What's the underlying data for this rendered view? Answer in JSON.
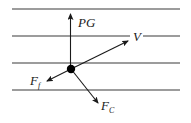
{
  "diagram": {
    "horizontal_lines_count": 4,
    "vectors": [
      {
        "id": "pg",
        "label": "PG",
        "subscript": "",
        "direction": "up"
      },
      {
        "id": "v",
        "label": "V",
        "subscript": "",
        "direction": "up-right"
      },
      {
        "id": "ff",
        "label": "F",
        "subscript": "f",
        "direction": "down-left"
      },
      {
        "id": "fc",
        "label": "F",
        "subscript": "C",
        "direction": "down-right"
      }
    ],
    "colors": {
      "line": "#3a3a3a",
      "vector": "#1a1a1a",
      "particle": "#000000"
    }
  }
}
